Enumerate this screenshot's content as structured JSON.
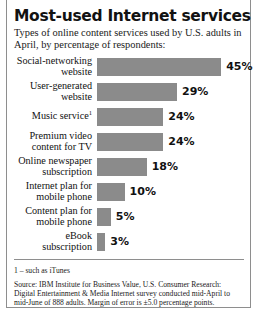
{
  "header": {
    "title": "Most-used Internet services",
    "subtitle": "Types of online content services used by U.S. adults in April, by percentage of respondents:"
  },
  "footer": {
    "footnote": "1 – such as iTunes",
    "source": "Source: IBM Institute for Business Value, U.S. Consumer Research: Digital Entertainment & Media Internet survey conducted mid-April to mid-June of 888 adults. Margin of error is ±5.0 percentage points."
  },
  "style": {
    "bar_color": "#8b8b8b",
    "text_color": "#111111",
    "rule_color": "#8e8e8e",
    "background": "#ffffff"
  },
  "chart_data": {
    "type": "bar",
    "orientation": "horizontal",
    "title": "Most-used Internet services",
    "subtitle": "Types of online content services used by U.S. adults in April, by percentage of respondents:",
    "xlabel": "",
    "ylabel": "",
    "xlim": [
      0,
      45
    ],
    "grid": false,
    "legend": false,
    "value_suffix": "%",
    "categories": [
      "Social-networking website",
      "User-generated website",
      "Music service¹",
      "Premium video content for TV",
      "Online newspaper subscription",
      "Internet plan for mobile phone",
      "Content plan for mobile phone",
      "eBook subscription"
    ],
    "values": [
      45,
      29,
      24,
      24,
      18,
      10,
      5,
      3
    ],
    "labels": [
      "45%",
      "29%",
      "24%",
      "24%",
      "18%",
      "10%",
      "5%",
      "3%"
    ],
    "rows": [
      {
        "line1": "Social-networking",
        "line2": "website",
        "sup": "",
        "value": 45,
        "label": "45%"
      },
      {
        "line1": "User-generated",
        "line2": "website",
        "sup": "",
        "value": 29,
        "label": "29%"
      },
      {
        "line1": "Music service",
        "line2": "",
        "sup": "1",
        "value": 24,
        "label": "24%"
      },
      {
        "line1": "Premium video",
        "line2": "content for TV",
        "sup": "",
        "value": 24,
        "label": "24%"
      },
      {
        "line1": "Online newspaper",
        "line2": "subscription",
        "sup": "",
        "value": 18,
        "label": "18%"
      },
      {
        "line1": "Internet plan for",
        "line2": "mobile phone",
        "sup": "",
        "value": 10,
        "label": "10%"
      },
      {
        "line1": "Content plan for",
        "line2": "mobile phone",
        "sup": "",
        "value": 5,
        "label": "5%"
      },
      {
        "line1": "eBook subscription",
        "line2": "",
        "sup": "",
        "value": 3,
        "label": "3%"
      }
    ]
  }
}
